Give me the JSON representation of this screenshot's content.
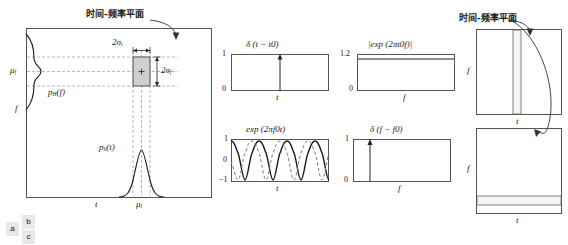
{
  "figure": {
    "title_cn": "时间-频率平面",
    "panel_labels": {
      "a": "a",
      "b": "b",
      "c": "c"
    }
  },
  "panel_a": {
    "caption": "时间-频率平面",
    "axis_y_label": "f",
    "axis_x_label": "t",
    "mean_f_label": "μf",
    "mean_t_label": "μt",
    "marginal_f_label": "pH(f)",
    "marginal_t_label": "ph(t)",
    "width_t_label": "2σt",
    "width_f_label": "2σf",
    "tile_center_marker": "+"
  },
  "panel_b": {
    "plots": [
      {
        "id": "delta-t",
        "title": "δ (t − t0)",
        "xlabel": "t",
        "ylabels": [
          "1",
          "0"
        ],
        "kind": "impulse",
        "impulse_x_frac": 0.5,
        "ylim": [
          0,
          1
        ]
      },
      {
        "id": "exp-f",
        "title": "|exp (2πt0f)|",
        "xlabel": "f",
        "ylabels": [
          "1.2",
          "0"
        ],
        "kind": "constant",
        "constant_value": 1.1,
        "ylim": [
          0,
          1.2
        ]
      },
      {
        "id": "exp-t",
        "title": "exp (2πf0t)",
        "xlabel": "t",
        "ylabels": [
          "1",
          "0",
          "−1"
        ],
        "kind": "sinusoid",
        "cycles": 3.5,
        "ylim": [
          -1,
          1
        ],
        "series": [
          {
            "name": "real",
            "style": "solid",
            "phase_deg": 0
          },
          {
            "name": "imag",
            "style": "dashed",
            "phase_deg": 90
          }
        ]
      },
      {
        "id": "delta-f",
        "title": "δ (f − f0)",
        "xlabel": "f",
        "ylabels": [
          "1",
          "0"
        ],
        "kind": "impulse",
        "impulse_x_frac": 0.17,
        "ylim": [
          0,
          1
        ]
      }
    ]
  },
  "panel_c": {
    "caption": "时间-频率平面",
    "top": {
      "axis_y_label": "f",
      "axis_x_label": "t",
      "band_orientation": "vertical",
      "band_start_frac": 0.42,
      "band_end_frac": 0.5
    },
    "bottom": {
      "axis_y_label": "f",
      "axis_x_label": "t",
      "band_orientation": "horizontal",
      "band_start_frac": 0.8,
      "band_end_frac": 0.9
    }
  },
  "colors": {
    "stroke": "#555555",
    "curve": "#1a1a1a",
    "grid_dash": "#9a9a9a",
    "tile_fill": "#cfcfcf",
    "band_fill": "#f2f2f2",
    "label_bg": "#e8e8e8"
  }
}
